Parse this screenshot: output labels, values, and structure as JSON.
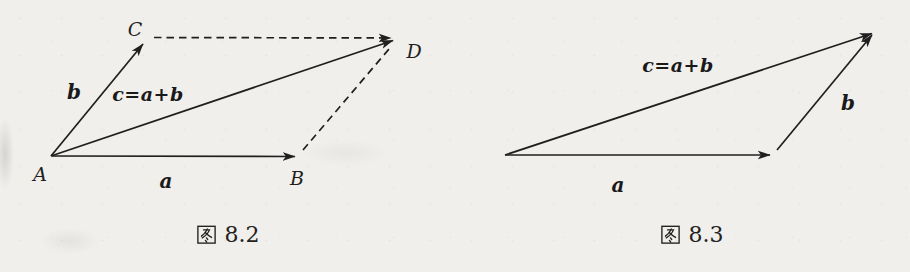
{
  "colors": {
    "ink": "#1f1f1f",
    "paper": "#f0efec"
  },
  "figures": [
    {
      "name": "parallelogram-rule-of-vector-addition",
      "caption": "图 8.2",
      "caption_number": "8.2",
      "vertex_labels": {
        "A": "A",
        "B": "B",
        "C": "C",
        "D": "D"
      },
      "vector_labels": {
        "a": "a",
        "b": "b",
        "sum": "c=a+b"
      }
    },
    {
      "name": "triangle-rule-of-vector-addition",
      "caption": "图 8.3",
      "caption_number": "8.3",
      "vector_labels": {
        "a": "a",
        "b": "b",
        "sum": "c=a+b"
      }
    }
  ]
}
